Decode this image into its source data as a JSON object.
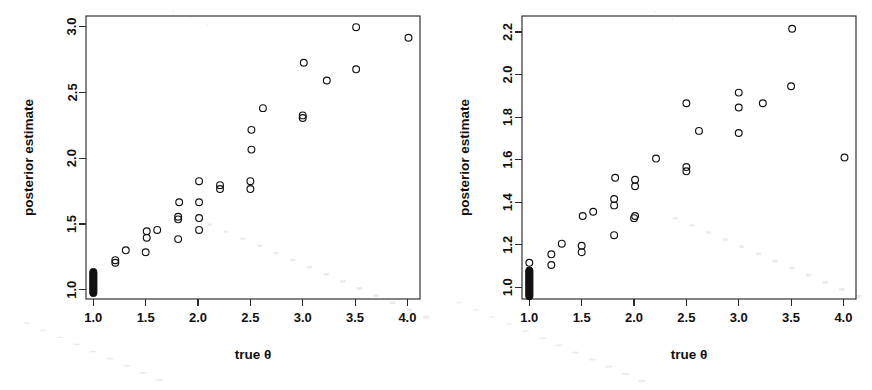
{
  "figure": {
    "name": "posterior-estimate-scatter-pair",
    "background_color": "#ffffff",
    "foreground_color": "#111111",
    "panel_count": 2
  },
  "chart_data": [
    {
      "type": "scatter",
      "panel_id": "left",
      "panel_label": "left-panel",
      "title": "",
      "xlabel": "true θ",
      "ylabel": "posterior estimate",
      "xlim": [
        0.93,
        4.12
      ],
      "ylim": [
        0.93,
        3.08
      ],
      "xticks": [
        1.0,
        1.5,
        2.0,
        2.5,
        3.0,
        3.5,
        4.0
      ],
      "xticklabels": [
        "1.0",
        "1.5",
        "2.0",
        "2.5",
        "3.0",
        "3.5",
        "4.0"
      ],
      "yticks": [
        1.0,
        1.5,
        2.0,
        2.5,
        3.0
      ],
      "yticklabels": [
        "1.0",
        "1.5",
        "2.0",
        "2.5",
        "3.0"
      ],
      "grid": false,
      "legend": null,
      "marker": "open-circle",
      "marker_size_px": 4.0,
      "points": [
        [
          1.0,
          0.97
        ],
        [
          1.0,
          0.98
        ],
        [
          1.0,
          0.985
        ],
        [
          1.0,
          0.99
        ],
        [
          1.0,
          0.995
        ],
        [
          1.0,
          1.0
        ],
        [
          1.0,
          1.0
        ],
        [
          1.0,
          1.005
        ],
        [
          1.0,
          1.01
        ],
        [
          1.0,
          1.015
        ],
        [
          1.0,
          1.02
        ],
        [
          1.0,
          1.025
        ],
        [
          1.0,
          1.03
        ],
        [
          1.0,
          1.035
        ],
        [
          1.0,
          1.04
        ],
        [
          1.0,
          1.045
        ],
        [
          1.0,
          1.05
        ],
        [
          1.0,
          1.055
        ],
        [
          1.0,
          1.06
        ],
        [
          1.0,
          1.065
        ],
        [
          1.0,
          1.07
        ],
        [
          1.0,
          1.075
        ],
        [
          1.0,
          1.08
        ],
        [
          1.0,
          1.085
        ],
        [
          1.0,
          1.09
        ],
        [
          1.0,
          1.095
        ],
        [
          1.0,
          1.1
        ],
        [
          1.0,
          1.105
        ],
        [
          1.0,
          1.11
        ],
        [
          1.0,
          1.115
        ],
        [
          1.0,
          1.12
        ],
        [
          1.0,
          1.125
        ],
        [
          1.0,
          1.13
        ],
        [
          1.0,
          1.135
        ],
        [
          1.0,
          1.14
        ],
        [
          1.21,
          1.205
        ],
        [
          1.21,
          1.225
        ],
        [
          1.31,
          1.3
        ],
        [
          1.5,
          1.285
        ],
        [
          1.51,
          1.395
        ],
        [
          1.51,
          1.445
        ],
        [
          1.61,
          1.455
        ],
        [
          1.81,
          1.385
        ],
        [
          1.81,
          1.535
        ],
        [
          1.81,
          1.555
        ],
        [
          1.82,
          1.665
        ],
        [
          2.01,
          1.455
        ],
        [
          2.01,
          1.545
        ],
        [
          2.01,
          1.665
        ],
        [
          2.01,
          1.825
        ],
        [
          2.21,
          1.765
        ],
        [
          2.21,
          1.795
        ],
        [
          2.5,
          1.765
        ],
        [
          2.5,
          1.825
        ],
        [
          2.51,
          2.065
        ],
        [
          2.51,
          2.215
        ],
        [
          2.62,
          2.38
        ],
        [
          3.0,
          2.305
        ],
        [
          3.0,
          2.325
        ],
        [
          3.01,
          2.725
        ],
        [
          3.23,
          2.59
        ],
        [
          3.51,
          2.675
        ],
        [
          3.51,
          2.995
        ],
        [
          4.01,
          2.915
        ]
      ],
      "dense_cluster": {
        "x": 1.0,
        "y_min": 0.965,
        "y_max": 1.145,
        "description": "overplotted solid band of posterior estimates at true theta = 1.0"
      }
    },
    {
      "type": "scatter",
      "panel_id": "right",
      "panel_label": "right-panel",
      "title": "",
      "xlabel": "true θ",
      "ylabel": "posterior estimate",
      "xlim": [
        0.93,
        4.12
      ],
      "ylim": [
        0.945,
        2.275
      ],
      "xticks": [
        1.0,
        1.5,
        2.0,
        2.5,
        3.0,
        3.5,
        4.0
      ],
      "xticklabels": [
        "1.0",
        "1.5",
        "2.0",
        "2.5",
        "3.0",
        "3.5",
        "4.0"
      ],
      "yticks": [
        1.0,
        1.2,
        1.4,
        1.6,
        1.8,
        2.0,
        2.2
      ],
      "yticklabels": [
        "1.0",
        "1.2",
        "1.4",
        "1.6",
        "1.8",
        "2.0",
        "2.2"
      ],
      "grid": false,
      "legend": null,
      "marker": "open-circle",
      "marker_size_px": 4.0,
      "points": [
        [
          1.0,
          0.955
        ],
        [
          1.0,
          0.96
        ],
        [
          1.0,
          0.965
        ],
        [
          1.0,
          0.97
        ],
        [
          1.0,
          0.975
        ],
        [
          1.0,
          0.98
        ],
        [
          1.0,
          0.985
        ],
        [
          1.0,
          0.99
        ],
        [
          1.0,
          0.995
        ],
        [
          1.0,
          1.0
        ],
        [
          1.0,
          1.0
        ],
        [
          1.0,
          1.005
        ],
        [
          1.0,
          1.01
        ],
        [
          1.0,
          1.015
        ],
        [
          1.0,
          1.02
        ],
        [
          1.0,
          1.025
        ],
        [
          1.0,
          1.03
        ],
        [
          1.0,
          1.035
        ],
        [
          1.0,
          1.04
        ],
        [
          1.0,
          1.045
        ],
        [
          1.0,
          1.05
        ],
        [
          1.0,
          1.055
        ],
        [
          1.0,
          1.06
        ],
        [
          1.0,
          1.065
        ],
        [
          1.0,
          1.07
        ],
        [
          1.0,
          1.075
        ],
        [
          1.0,
          1.08
        ],
        [
          1.0,
          1.115
        ],
        [
          1.21,
          1.105
        ],
        [
          1.21,
          1.155
        ],
        [
          1.31,
          1.205
        ],
        [
          1.5,
          1.165
        ],
        [
          1.5,
          1.195
        ],
        [
          1.51,
          1.335
        ],
        [
          1.61,
          1.355
        ],
        [
          1.81,
          1.245
        ],
        [
          1.81,
          1.385
        ],
        [
          1.81,
          1.415
        ],
        [
          1.82,
          1.515
        ],
        [
          2.0,
          1.325
        ],
        [
          2.01,
          1.335
        ],
        [
          2.01,
          1.475
        ],
        [
          2.01,
          1.505
        ],
        [
          2.21,
          1.605
        ],
        [
          2.5,
          1.545
        ],
        [
          2.5,
          1.565
        ],
        [
          2.5,
          1.865
        ],
        [
          2.62,
          1.735
        ],
        [
          3.0,
          1.725
        ],
        [
          3.0,
          1.845
        ],
        [
          3.0,
          1.915
        ],
        [
          3.23,
          1.865
        ],
        [
          3.5,
          1.945
        ],
        [
          3.51,
          2.215
        ],
        [
          4.01,
          1.61
        ]
      ],
      "dense_cluster": {
        "x": 1.0,
        "y_min": 0.952,
        "y_max": 1.085,
        "description": "overplotted solid band of posterior estimates at true theta = 1.0"
      }
    }
  ]
}
